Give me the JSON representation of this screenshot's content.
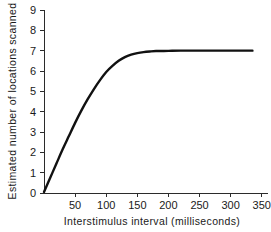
{
  "chart_data": {
    "type": "line",
    "title": "",
    "xlabel": "Interstimulus interval  (milliseconds)",
    "ylabel": "Estimated number of locations scanned",
    "xlim": [
      0,
      360
    ],
    "ylim": [
      0,
      9
    ],
    "xticks": [
      50,
      100,
      150,
      200,
      250,
      300,
      350
    ],
    "xtick_labels": [
      "50",
      "100",
      "150",
      "200",
      "250",
      "300",
      "350"
    ],
    "yticks": [
      0,
      1,
      2,
      3,
      4,
      5,
      6,
      7,
      8,
      9
    ],
    "ytick_labels": [
      "0",
      "1",
      "2",
      "3",
      "4",
      "5",
      "6",
      "7",
      "8",
      "9"
    ],
    "grid": false,
    "legend": "none",
    "asymptote": 7,
    "series": [
      {
        "name": "Estimated locations scanned",
        "color": "#111111",
        "x": [
          0,
          10,
          20,
          30,
          40,
          50,
          60,
          70,
          80,
          90,
          100,
          110,
          120,
          130,
          140,
          150,
          160,
          170,
          180,
          200,
          220,
          250,
          280,
          310,
          335
        ],
        "y": [
          0.05,
          0.75,
          1.45,
          2.15,
          2.8,
          3.45,
          4.05,
          4.6,
          5.1,
          5.55,
          5.95,
          6.25,
          6.5,
          6.68,
          6.8,
          6.88,
          6.93,
          6.96,
          6.98,
          6.99,
          7.0,
          7.0,
          7.0,
          7.0,
          7.0
        ]
      }
    ]
  },
  "axis_geometry": {
    "left_px": 44,
    "right_px": 268,
    "top_px": 10,
    "bottom_px": 193,
    "x_per_unit": 0.6486,
    "y_per_unit": 20.33
  },
  "colors": {
    "background": "#ffffff",
    "axis": "#2b2b2b",
    "curve": "#111111",
    "text": "#1a1a1a"
  }
}
